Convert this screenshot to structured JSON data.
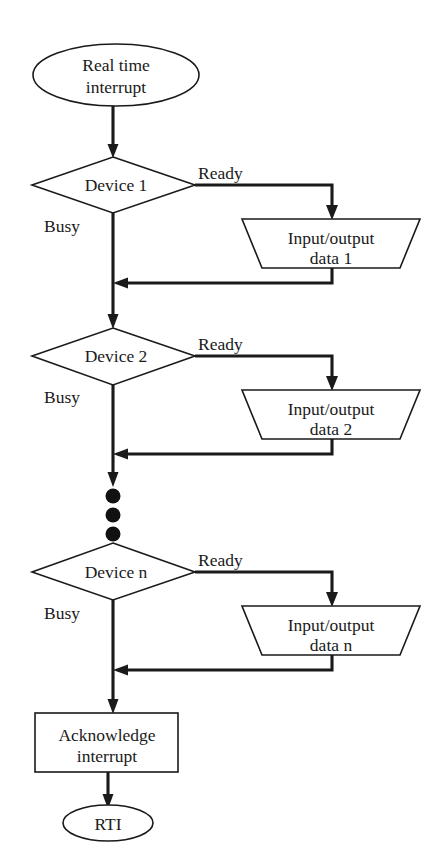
{
  "diagram": {
    "type": "flowchart",
    "colors": {
      "background": "#ffffff",
      "stroke": "#1a1a1a",
      "shape_fill": "#ffffff"
    },
    "start": {
      "shape": "ellipse",
      "line1": "Real time",
      "line2": "interrupt"
    },
    "branches": [
      {
        "decision_label": "Device 1",
        "busy_label": "Busy",
        "ready_label": "Ready",
        "process_line1": "Input/output",
        "process_line2": "data 1"
      },
      {
        "decision_label": "Device 2",
        "busy_label": "Busy",
        "ready_label": "Ready",
        "process_line1": "Input/output",
        "process_line2": "data 2"
      },
      {
        "decision_label": "Device n",
        "busy_label": "Busy",
        "ready_label": "Ready",
        "process_line1": "Input/output",
        "process_line2": "data n"
      }
    ],
    "ellipsis": {
      "dot_count": 3,
      "meaning": "continuation"
    },
    "acknowledge": {
      "shape": "rectangle",
      "line1": "Acknowledge",
      "line2": "interrupt"
    },
    "end": {
      "shape": "ellipse",
      "label": "RTI"
    }
  }
}
